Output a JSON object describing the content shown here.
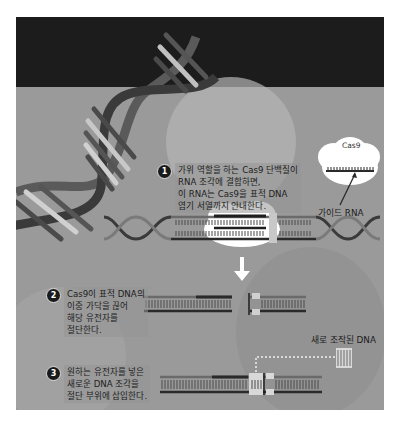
{
  "figure": {
    "colors": {
      "top_band": "#1c1c1c",
      "background": "#9a9a9a",
      "strand_dark": "#2a2a2a",
      "strand_light": "#777777",
      "cloud": "#ffffff",
      "badge": "#1a1a1a"
    }
  },
  "cas9_inset": {
    "protein_label": "Cas9",
    "guide_label": "가이드 RNA"
  },
  "steps": [
    {
      "number": "1",
      "lines": [
        "가위 역할을 하는 Cas9 단백질이",
        "RNA 조각에 결합하면,",
        "이 RNA는 Cas9을 표적 DNA",
        "염기 서열까지 안내한다."
      ]
    },
    {
      "number": "2",
      "lines": [
        "Cas9이 표적 DNA의",
        "이중 가닥을 끊어",
        "해당 유전자를",
        "절단한다."
      ]
    },
    {
      "number": "3",
      "lines": [
        "원하는 유전자를 넣은",
        "새로운 DNA 조각을",
        "절단 부위에 삽입한다."
      ]
    }
  ],
  "new_dna_label": "새로 조작된 DNA"
}
